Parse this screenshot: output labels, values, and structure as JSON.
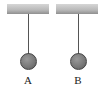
{
  "diagram": {
    "pendulums": [
      {
        "label": "A"
      },
      {
        "label": "B"
      }
    ]
  }
}
